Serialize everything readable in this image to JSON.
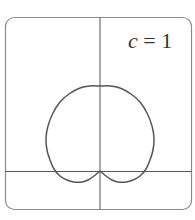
{
  "chart_data": {
    "type": "line",
    "title": "",
    "annotation": {
      "var": "c",
      "eq": " = ",
      "value": "1"
    },
    "xlabel": "",
    "ylabel": "",
    "grid": false,
    "axes_visible": true,
    "frame": "rounded-rectangle",
    "curve": "cardioid-like closed curve with cusp at origin, bulb above x-axis and two small lobes below",
    "series": [
      {
        "name": "c = 1",
        "color": "#555555",
        "points_px": [
          [
            100,
            171
          ],
          [
            106,
            176
          ],
          [
            112,
            180
          ],
          [
            118,
            182
          ],
          [
            126,
            182
          ],
          [
            133,
            180
          ],
          [
            140,
            176
          ],
          [
            146,
            169
          ],
          [
            150,
            160
          ],
          [
            153,
            150
          ],
          [
            154,
            138
          ],
          [
            152,
            126
          ],
          [
            147,
            113
          ],
          [
            140,
            102
          ],
          [
            131,
            94
          ],
          [
            120,
            88
          ],
          [
            110,
            86
          ],
          [
            100,
            86
          ],
          [
            90,
            86
          ],
          [
            80,
            88
          ],
          [
            69,
            94
          ],
          [
            60,
            102
          ],
          [
            53,
            113
          ],
          [
            48,
            126
          ],
          [
            46,
            138
          ],
          [
            47,
            150
          ],
          [
            50,
            160
          ],
          [
            54,
            169
          ],
          [
            60,
            176
          ],
          [
            67,
            180
          ],
          [
            74,
            182
          ],
          [
            82,
            182
          ],
          [
            88,
            180
          ],
          [
            94,
            176
          ],
          [
            100,
            171
          ]
        ]
      }
    ]
  },
  "colors": {
    "frame": "#8a8a8a",
    "axes": "#555555",
    "curve": "#555555",
    "text": "#333333"
  }
}
